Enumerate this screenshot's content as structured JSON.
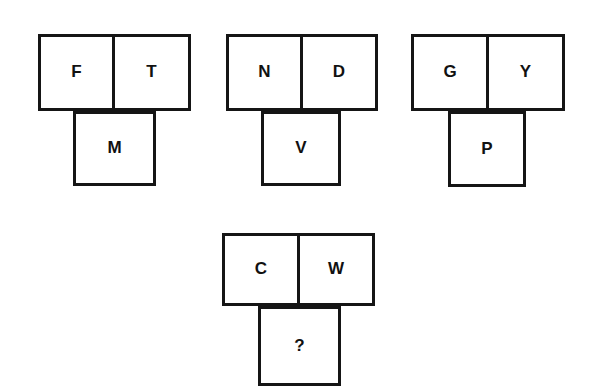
{
  "puzzle": {
    "type": "verbal-analogy-grid",
    "background_color": "#ffffff",
    "line_color": "#151515",
    "text_color": "#111111",
    "figures": [
      {
        "name": "figure-1",
        "top_left": "F",
        "top_right": "T",
        "bottom": "M",
        "layout": {
          "left": 38,
          "top": 34,
          "cell_width": 77,
          "cell_height": 77,
          "bottom_left_offset": 35,
          "bottom_width": 83,
          "bottom_height": 75
        }
      },
      {
        "name": "figure-2",
        "top_left": "N",
        "top_right": "D",
        "bottom": "V",
        "layout": {
          "left": 226,
          "top": 34,
          "cell_width": 77,
          "cell_height": 77,
          "bottom_left_offset": 35,
          "bottom_width": 80,
          "bottom_height": 75
        }
      },
      {
        "name": "figure-3",
        "top_left": "G",
        "top_right": "Y",
        "bottom": "P",
        "layout": {
          "left": 411,
          "top": 34,
          "cell_width": 78,
          "cell_height": 77,
          "bottom_left_offset": 37,
          "bottom_width": 78,
          "bottom_height": 76
        }
      },
      {
        "name": "figure-4",
        "top_left": "C",
        "top_right": "W",
        "bottom": "?",
        "layout": {
          "left": 222,
          "top": 233,
          "cell_width": 78,
          "cell_height": 73,
          "bottom_left_offset": 36,
          "bottom_width": 83,
          "bottom_height": 80
        }
      }
    ]
  }
}
